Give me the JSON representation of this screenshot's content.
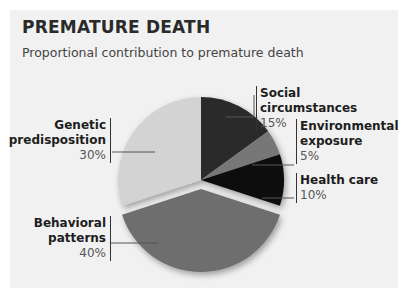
{
  "title": "PREMATURE DEATH",
  "subtitle": "Proportional contribution to premature death",
  "chart_data": {
    "type": "pie",
    "title": "PREMATURE DEATH",
    "subtitle": "Proportional contribution to premature death",
    "categories": [
      "Social circumstances",
      "Environmental exposure",
      "Health care",
      "Behavioral patterns",
      "Genetic predisposition"
    ],
    "values": [
      15,
      5,
      10,
      40,
      30
    ],
    "unit": "%",
    "colors": [
      "#2b2b2b",
      "#777777",
      "#0d0d0d",
      "#6e6e6e",
      "#d3d3d3"
    ],
    "exploded": [
      "Behavioral patterns"
    ],
    "legend": "inline labels with leader lines"
  },
  "labels": {
    "social": {
      "line1": "Social",
      "line2": "circumstances",
      "pct": "15%"
    },
    "environmental": {
      "line1": "Environmental",
      "line2": "exposure",
      "pct": "5%"
    },
    "health": {
      "line1": "Health care",
      "pct": "10%"
    },
    "behavioral": {
      "line1": "Behavioral",
      "line2": "patterns",
      "pct": "40%"
    },
    "genetic": {
      "line1": "Genetic",
      "line2": "predisposition",
      "pct": "30%"
    }
  }
}
